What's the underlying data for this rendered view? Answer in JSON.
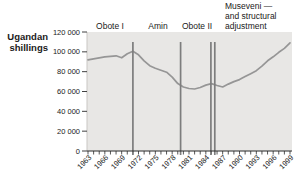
{
  "figure": {
    "y_axis_title": "Ugandan\nshillings"
  },
  "chart_data": {
    "type": "line",
    "title": "",
    "ylabel": "Ugandan shillings",
    "xlabel": "",
    "x": [
      1963,
      1964,
      1965,
      1966,
      1967,
      1968,
      1969,
      1970,
      1971,
      1972,
      1973,
      1974,
      1975,
      1976,
      1977,
      1978,
      1979,
      1980,
      1981,
      1982,
      1983,
      1984,
      1985,
      1986,
      1987,
      1988,
      1989,
      1990,
      1991,
      1992,
      1993,
      1994,
      1995,
      1996,
      1997,
      1998,
      1999
    ],
    "values": [
      92000,
      93000,
      94000,
      95000,
      95500,
      96000,
      94000,
      98000,
      100500,
      97000,
      91000,
      86000,
      83500,
      81500,
      79500,
      74500,
      68000,
      64500,
      63000,
      62500,
      64000,
      66500,
      68000,
      66000,
      64500,
      67500,
      70000,
      72000,
      75000,
      78000,
      81000,
      85500,
      91000,
      95000,
      99500,
      103500,
      109000
    ],
    "xlim": [
      1963,
      1999
    ],
    "ylim": [
      0,
      120000
    ],
    "x_tick_labels": [
      "1963",
      "1966",
      "1969",
      "1972",
      "1975",
      "1978",
      "1981",
      "1984",
      "1987",
      "1990",
      "1993",
      "1996",
      "1999"
    ],
    "y_tick_values": [
      0,
      20000,
      40000,
      60000,
      80000,
      100000,
      120000
    ],
    "y_tick_labels": [
      "0",
      "20 000",
      "40 000",
      "60 000",
      "80 000",
      "100 000",
      "120 000"
    ],
    "grid": "off",
    "legend": "none",
    "plot_bg": "light-gray panel",
    "annotations": {
      "obote1": "Obote I",
      "amin": "Amin",
      "obote2": "Obote II",
      "museveni": "Museveni —\nand structural\nadjustment"
    },
    "regime_markers": {
      "line_years": [
        1971,
        1979.5,
        1984.9,
        1985.6
      ],
      "description": "vertical gray lines marking regime changes; double line at 1985-86"
    },
    "colors": {
      "plot_bg": "#e8e7e5",
      "line": "#969696",
      "marker_line": "#7d7d7d",
      "axis": "#2b2b2b",
      "text": "#1a1a1a"
    }
  }
}
